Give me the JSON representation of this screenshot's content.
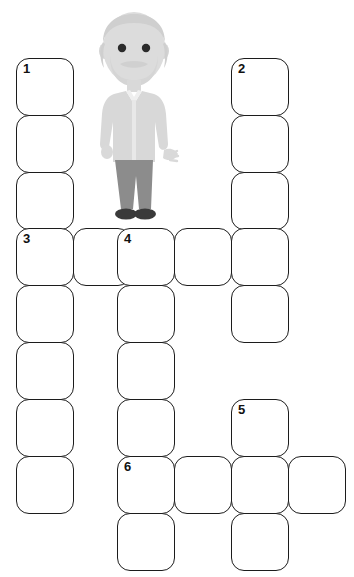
{
  "puzzle": {
    "title": "Crossword puzzle grid",
    "cell_size": 58,
    "border_color": "#1c1c1c",
    "background_color": "#ffffff",
    "clue_numbers": [
      "1",
      "2",
      "3",
      "4",
      "5",
      "6"
    ],
    "cells": [
      {
        "name": "cell-c0-r0",
        "col": 0,
        "row": 0,
        "number": "1",
        "letter": ""
      },
      {
        "name": "cell-c0-r1",
        "col": 0,
        "row": 1,
        "number": "",
        "letter": ""
      },
      {
        "name": "cell-c0-r2",
        "col": 0,
        "row": 2,
        "number": "",
        "letter": ""
      },
      {
        "name": "cell-c4-r0",
        "col": 4,
        "row": 0,
        "number": "2",
        "letter": ""
      },
      {
        "name": "cell-c4-r1",
        "col": 4,
        "row": 1,
        "number": "",
        "letter": ""
      },
      {
        "name": "cell-c4-r2",
        "col": 4,
        "row": 2,
        "number": "",
        "letter": ""
      },
      {
        "name": "cell-c0-r3",
        "col": 0,
        "row": 3,
        "number": "3",
        "letter": ""
      },
      {
        "name": "cell-c1-r3",
        "col": 1,
        "row": 3,
        "number": "",
        "letter": ""
      },
      {
        "name": "cell-c2-r3",
        "col": 2,
        "row": 3,
        "number": "4",
        "letter": ""
      },
      {
        "name": "cell-c3-r3",
        "col": 3,
        "row": 3,
        "number": "",
        "letter": ""
      },
      {
        "name": "cell-c4-r3",
        "col": 4,
        "row": 3,
        "number": "",
        "letter": ""
      },
      {
        "name": "cell-c0-r4",
        "col": 0,
        "row": 4,
        "number": "",
        "letter": ""
      },
      {
        "name": "cell-c2-r4",
        "col": 2,
        "row": 4,
        "number": "",
        "letter": ""
      },
      {
        "name": "cell-c4-r4",
        "col": 4,
        "row": 4,
        "number": "",
        "letter": ""
      },
      {
        "name": "cell-c0-r5",
        "col": 0,
        "row": 5,
        "number": "",
        "letter": ""
      },
      {
        "name": "cell-c2-r5",
        "col": 2,
        "row": 5,
        "number": "",
        "letter": ""
      },
      {
        "name": "cell-c0-r6",
        "col": 0,
        "row": 6,
        "number": "",
        "letter": ""
      },
      {
        "name": "cell-c2-r6",
        "col": 2,
        "row": 6,
        "number": "",
        "letter": ""
      },
      {
        "name": "cell-c4-r6",
        "col": 4,
        "row": 6,
        "number": "5",
        "letter": ""
      },
      {
        "name": "cell-c0-r7",
        "col": 0,
        "row": 7,
        "number": "",
        "letter": ""
      },
      {
        "name": "cell-c2-r7",
        "col": 2,
        "row": 7,
        "number": "6",
        "letter": ""
      },
      {
        "name": "cell-c3-r7",
        "col": 3,
        "row": 7,
        "number": "",
        "letter": ""
      },
      {
        "name": "cell-c4-r7",
        "col": 4,
        "row": 7,
        "number": "",
        "letter": ""
      },
      {
        "name": "cell-c5-r7",
        "col": 5,
        "row": 7,
        "number": "",
        "letter": ""
      },
      {
        "name": "cell-c2-r8",
        "col": 2,
        "row": 8,
        "number": "",
        "letter": ""
      },
      {
        "name": "cell-c4-r8",
        "col": 4,
        "row": 8,
        "number": "",
        "letter": ""
      }
    ]
  },
  "illustration": {
    "name": "elderly-man-illustration",
    "description": "Illustration of an elderly man with grey hair and beard",
    "colors": {
      "skin": "#d9d9d9",
      "hair": "#cfcfcf",
      "shirt": "#e0e0e0",
      "jacket": "#d2d2d2",
      "trousers": "#8c8c8c",
      "shoes": "#3a3a3a",
      "eyes": "#2b2b2b"
    }
  }
}
